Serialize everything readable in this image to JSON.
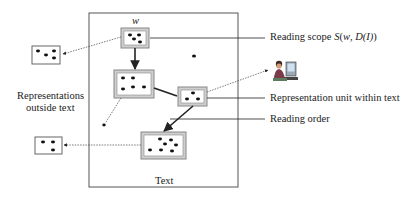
{
  "diagram": {
    "text_box_label": "Text",
    "word_label": "w",
    "left_label_line1": "Representations",
    "left_label_line2": "outside text",
    "callouts": {
      "reading_scope_prefix": "Reading scope ",
      "reading_scope_formula_S": "S",
      "reading_scope_formula_open": "(",
      "reading_scope_formula_w": "w",
      "reading_scope_formula_sep": ", ",
      "reading_scope_formula_D": "D",
      "reading_scope_formula_I": "(I)",
      "reading_scope_formula_close": ")",
      "representation_unit": "Representation unit within text",
      "reading_order": "Reading order"
    },
    "icons": {
      "person_at_computer": "person-computer-icon"
    },
    "colors": {
      "line": "#333333",
      "box_border": "#888888",
      "box_fill": "#dddddd",
      "dot": "#111111"
    }
  }
}
